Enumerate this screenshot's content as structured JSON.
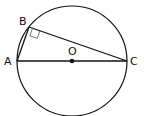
{
  "figure": {
    "type": "circle-inscribed-triangle",
    "circle": {
      "center_label": "O",
      "center": [
        72,
        61
      ],
      "radius": 55
    },
    "points": {
      "A": {
        "label": "A",
        "pos": [
          17,
          61
        ]
      },
      "B": {
        "label": "B",
        "pos": [
          29,
          27
        ]
      },
      "C": {
        "label": "C",
        "pos": [
          127,
          61
        ]
      },
      "O": {
        "label": "O",
        "pos": [
          72,
          61
        ]
      }
    },
    "segments": [
      "AB",
      "BC",
      "AC"
    ],
    "right_angle_at": "B",
    "stroke_color": "#111111"
  }
}
